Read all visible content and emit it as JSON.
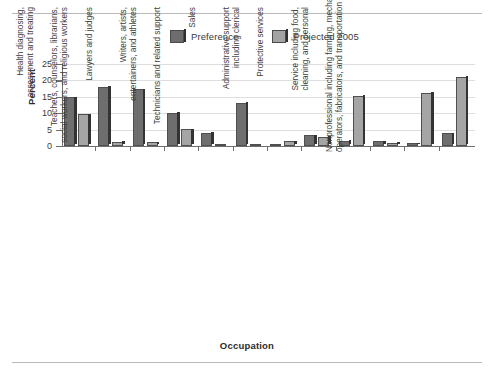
{
  "chart_data": {
    "type": "bar",
    "title": "",
    "xlabel": "Occupation",
    "ylabel": "Percent",
    "ylim": [
      0,
      25
    ],
    "yticks": [
      0,
      5,
      10,
      15,
      20,
      25
    ],
    "grid": true,
    "legend_position": "top-center",
    "categories": [
      "Executive, administrative, managerial",
      "Engineers, architects, natural and social scientists",
      "Health diagnosing, assessment and treating",
      "Teachers, counselors, librarians, social workers, and religious workers",
      "Lawyers and judges",
      "Writers, artists, entertainers, and athletes",
      "Technicians and related support",
      "Sales",
      "Administrative support including clerical",
      "Protective services",
      "Service including food, cleaning, and personal",
      "Nonprofessional including farming, mechanics, operators, fabricators, and transportation"
    ],
    "category_lines": [
      [
        "Executive, administrative,",
        "managerial"
      ],
      [
        "Engineers, architects, natural",
        "and social scientists"
      ],
      [
        "Health diagnosing,",
        "assessment and treating"
      ],
      [
        "Teachers, counselors, librarians,",
        "social workers, and religious workers"
      ],
      [
        "Lawyers and judges"
      ],
      [
        "Writers, artists,",
        "entertainers, and athletes"
      ],
      [
        "Technicians and related support"
      ],
      [
        "Sales"
      ],
      [
        "Administrative support",
        "including clerical"
      ],
      [
        "Protective services"
      ],
      [
        "Service including food,",
        "cleaning, and personal"
      ],
      [
        "Nonprofessional including farming, mechanics,",
        "operators, fabricators, and transportation"
      ]
    ],
    "series": [
      {
        "name": "Preference",
        "color": "#6e6e6e",
        "values": [
          14.8,
          18.1,
          17.3,
          10.1,
          4.1,
          13.2,
          0.4,
          3.3,
          1.6,
          1.5,
          0.8,
          3.9
        ]
      },
      {
        "name": "Projected 2005",
        "color": "#a5a5a5",
        "values": [
          9.7,
          1.3,
          1.1,
          5.1,
          0.5,
          0.2,
          1.5,
          2.8,
          15.3,
          1.0,
          16.2,
          21.1
        ]
      }
    ]
  },
  "legend": {
    "items": [
      {
        "label": "Preference",
        "swatch": "dark-gray-swatch"
      },
      {
        "label": "Projected 2005",
        "swatch": "light-gray-swatch"
      }
    ]
  },
  "axes": {
    "y_title": "Percent",
    "x_title": "Occupation",
    "y_tick_labels": [
      "0",
      "5",
      "10",
      "15",
      "20",
      "25"
    ]
  }
}
